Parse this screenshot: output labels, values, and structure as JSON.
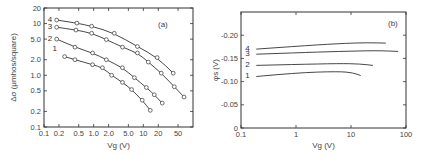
{
  "chart_data": [
    {
      "type": "line",
      "panel_label": "(a)",
      "xlabel": "Vg (V)",
      "ylabel": "Δσ (μmhos/square)",
      "xscale": "log",
      "yscale": "log",
      "xlim": [
        0.1,
        100
      ],
      "ylim": [
        0.1,
        20
      ],
      "xticks": [
        0.1,
        0.2,
        0.5,
        1.0,
        2.0,
        5.0,
        10,
        20,
        50
      ],
      "xtick_labels": [
        "0.1",
        "0.2",
        "0.5",
        "1.0",
        "2.0",
        "5.0",
        "10",
        "20",
        "50"
      ],
      "yticks": [
        0.1,
        0.2,
        0.5,
        1.0,
        2.0,
        5.0,
        10,
        20
      ],
      "ytick_labels": [
        "0.1",
        "0.2",
        "0.5",
        "1.0",
        "2.0",
        "5.0",
        "10",
        "20"
      ],
      "markers": "open-circle",
      "grid": false,
      "series": [
        {
          "name": "4",
          "x": [
            0.18,
            0.46,
            0.91,
            2.6,
            7.6,
            19,
            40
          ],
          "y": [
            11.7,
            10.2,
            8.9,
            6.5,
            3.6,
            2.2,
            1.1
          ]
        },
        {
          "name": "3",
          "x": [
            0.18,
            0.44,
            0.91,
            1.8,
            3.8,
            7.6,
            12.6,
            23,
            42,
            66
          ],
          "y": [
            8.5,
            7.5,
            6.5,
            4.9,
            3.5,
            2.7,
            1.8,
            1.1,
            0.6,
            0.38
          ]
        },
        {
          "name": "2",
          "x": [
            0.18,
            0.42,
            0.95,
            1.8,
            3.8,
            6.6,
            11.5,
            16.6,
            24
          ],
          "y": [
            5.0,
            3.5,
            2.7,
            2.0,
            1.4,
            0.9,
            0.58,
            0.42,
            0.29
          ]
        },
        {
          "name": "1",
          "x": [
            0.26,
            0.42,
            0.95,
            1.5,
            2.3,
            3.8,
            5.8,
            9.5,
            13.8
          ],
          "y": [
            2.3,
            2.0,
            1.6,
            1.4,
            1.0,
            0.73,
            0.53,
            0.33,
            0.21
          ]
        }
      ]
    },
    {
      "type": "line",
      "panel_label": "(b)",
      "xlabel": "Vg (V)",
      "ylabel": "φs (V)",
      "xscale": "log",
      "yscale": "linear",
      "xlim": [
        0.1,
        100
      ],
      "ylim": [
        0,
        -0.25
      ],
      "xticks": [
        0.1,
        1,
        10,
        100
      ],
      "xtick_labels": [
        "0.1",
        "1",
        "10",
        "100"
      ],
      "yticks": [
        0,
        -0.05,
        -0.1,
        -0.15,
        -0.2
      ],
      "ytick_labels": [
        "0",
        "-0.05",
        "-0.10",
        "-0.15",
        "-0.20"
      ],
      "markers": "none",
      "grid": false,
      "series": [
        {
          "name": "4",
          "x": [
            0.19,
            1,
            6,
            20,
            43
          ],
          "y": [
            -0.17,
            -0.176,
            -0.182,
            -0.184,
            -0.183
          ]
        },
        {
          "name": "3",
          "x": [
            0.19,
            1,
            6,
            30,
            72
          ],
          "y": [
            -0.159,
            -0.162,
            -0.165,
            -0.167,
            -0.165
          ]
        },
        {
          "name": "2",
          "x": [
            0.19,
            1,
            6,
            15,
            25
          ],
          "y": [
            -0.135,
            -0.137,
            -0.139,
            -0.138,
            -0.135
          ]
        },
        {
          "name": "1",
          "x": [
            0.19,
            1,
            6,
            11,
            15
          ],
          "y": [
            -0.111,
            -0.119,
            -0.122,
            -0.119,
            -0.113
          ]
        }
      ]
    }
  ]
}
